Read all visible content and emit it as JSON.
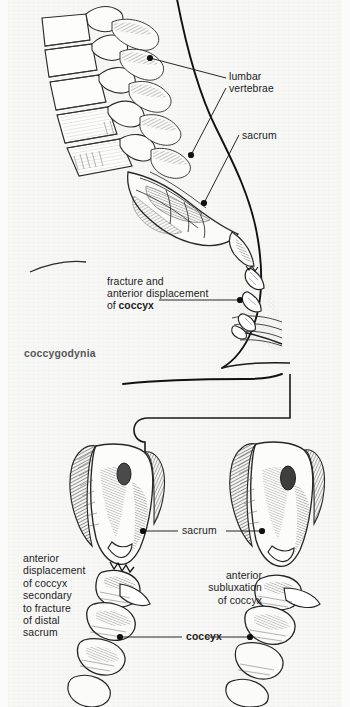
{
  "figure": {
    "caption": "coccygodynia",
    "background_color": "#f7f7f6",
    "ink_color": "#1c1c1c",
    "caption_color": "#55565a"
  },
  "upper_panel": {
    "description": "lateral view of lumbosacral spine, sacrum and fractured coccyx",
    "labels": {
      "lumbar_vertebrae": "lumbar\nvertebrae",
      "sacrum": "sacrum",
      "fracture_line1": "fracture and",
      "fracture_line2": "anterior displacement",
      "fracture_line3_prefix": "of ",
      "fracture_line3_bold": "coccyx"
    }
  },
  "lower_panel": {
    "description": "two posterior specimens of sacrum and coccyx",
    "labels": {
      "sacrum": "sacrum",
      "coccyx": "coccyx",
      "left_note": "anterior\ndisplacement\nof coccyx\nsecondary\nto fracture\nof distal\nsacrum",
      "right_note": "anterior\nsubluxation\nof coccyx"
    }
  }
}
